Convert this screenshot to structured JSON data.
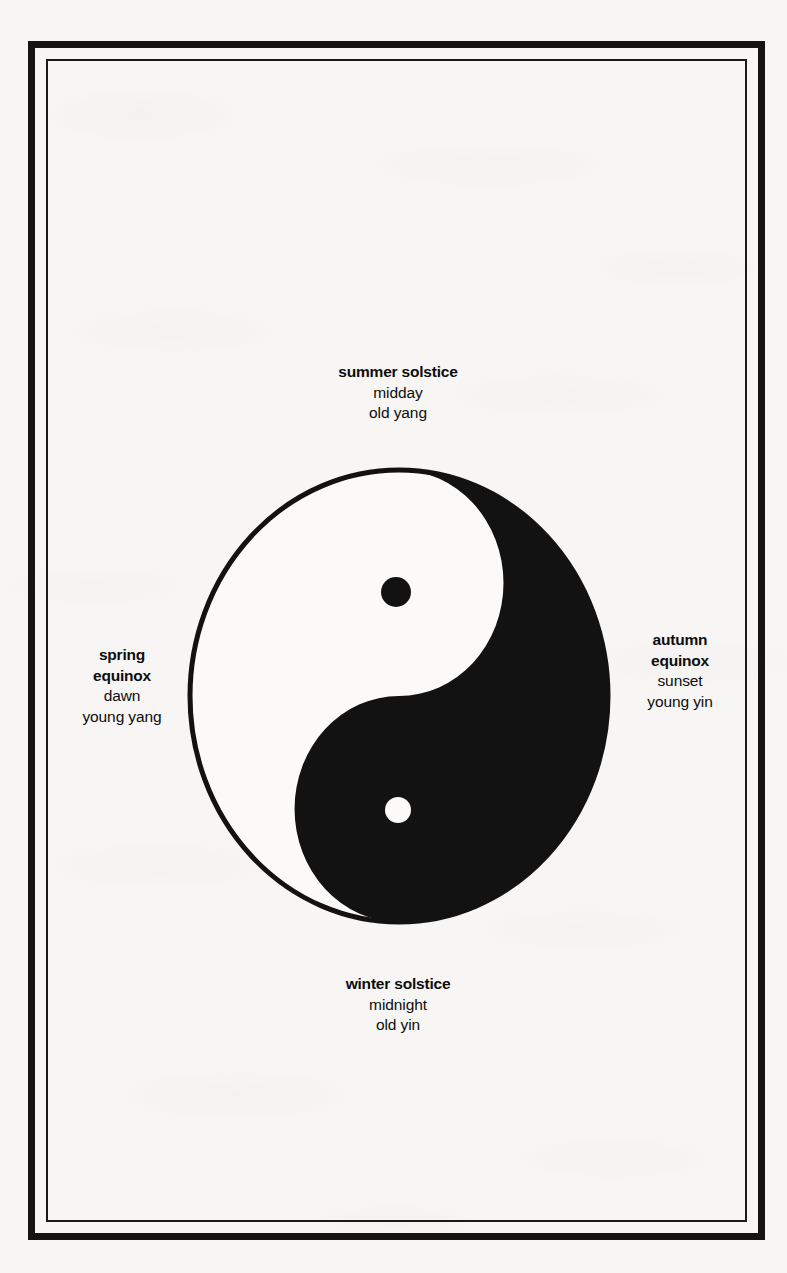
{
  "page": {
    "background_color": "#f7f6f4",
    "frame_color": "#141414",
    "medium": "scanned book page"
  },
  "diagram": {
    "name": "taijitu",
    "alt": "yin-yang symbol",
    "ink_color": "#121212",
    "light_color": "#fbfaf8",
    "orientation": "white (yang) left, black (yin) right",
    "dots": [
      {
        "name": "yin-dot",
        "fill": "#121212",
        "inside": "white half, upper"
      },
      {
        "name": "yang-dot",
        "fill": "#fbfaf8",
        "inside": "black half, lower"
      }
    ]
  },
  "labels": {
    "top": {
      "id": "summer",
      "lines": [
        {
          "text": "summer solstice",
          "bold": true
        },
        {
          "text": "midday",
          "bold": false
        },
        {
          "text": "old yang",
          "bold": false
        }
      ]
    },
    "bottom": {
      "id": "winter",
      "lines": [
        {
          "text": "winter solstice",
          "bold": true
        },
        {
          "text": "midnight",
          "bold": false
        },
        {
          "text": "old yin",
          "bold": false
        }
      ]
    },
    "left": {
      "id": "spring",
      "lines": [
        {
          "text": "spring",
          "bold": true
        },
        {
          "text": "equinox",
          "bold": true
        },
        {
          "text": "dawn",
          "bold": false
        },
        {
          "text": "young yang",
          "bold": false
        }
      ]
    },
    "right": {
      "id": "autumn",
      "lines": [
        {
          "text": "autumn",
          "bold": true
        },
        {
          "text": "equinox",
          "bold": true
        },
        {
          "text": "sunset",
          "bold": false
        },
        {
          "text": "young yin",
          "bold": false
        }
      ]
    }
  }
}
